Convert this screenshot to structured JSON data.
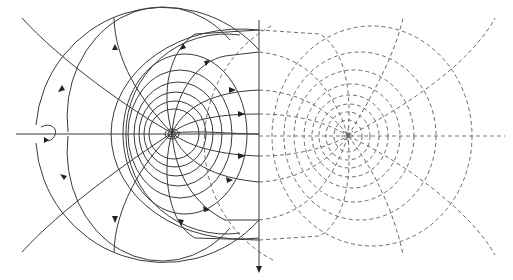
{
  "figure": {
    "type": "field-line diagram",
    "left_panel": {
      "style": "solid",
      "source_center": [
        172,
        133
      ],
      "description": "field lines (with arrows) radiating from a source, crossed by circular equipotential lines"
    },
    "right_panel": {
      "style": "dashed",
      "source_center": [
        348,
        136
      ],
      "description": "mirror-image dashed field and equipotential lines"
    },
    "vertical_axis_x": 259,
    "horizontal_axis_y": 134,
    "rotation_symbol": "circular-arrow",
    "colors": {
      "line": "#3a3a3a",
      "dashed": "#5a5a5a",
      "background": "#ffffff"
    }
  }
}
